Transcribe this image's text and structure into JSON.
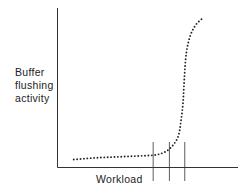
{
  "chart_data": {
    "type": "line",
    "title": "",
    "xlabel": "Workload",
    "ylabel_lines": [
      "Buffer",
      "flushing",
      "activity"
    ],
    "xlim": [
      0,
      100
    ],
    "ylim": [
      0,
      100
    ],
    "grid": false,
    "legend": "none",
    "line_style": "dotted",
    "series": [
      {
        "name": "buffer-flushing-activity",
        "x": [
          9,
          20,
          30,
          40,
          50,
          55,
          60,
          64,
          67,
          68.5,
          69.5,
          70,
          70.5,
          71,
          72,
          74,
          77,
          81
        ],
        "y": [
          5,
          6,
          6.5,
          7,
          7.5,
          8,
          10,
          14,
          20,
          30,
          40,
          50,
          60,
          68,
          76,
          84,
          90,
          94
        ]
      }
    ],
    "markers_x": [
      53,
      62,
      70.5
    ],
    "ticks": []
  },
  "colors": {
    "axis": "#333333",
    "curve": "#222222"
  }
}
